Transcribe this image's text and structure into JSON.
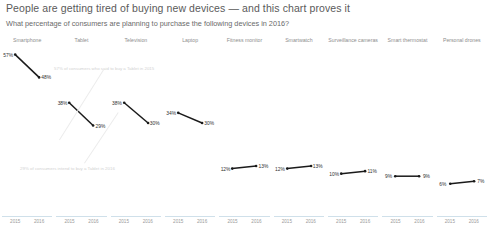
{
  "header": {
    "title": "People are getting tired of buying new devices — and this chart proves it",
    "subtitle": "What percentage of consumers are planning to purchase the following devices in 2016?"
  },
  "annotations": [
    {
      "text": "57% of consumers who said to buy a Tablet in 2015"
    },
    {
      "text": "29% of consumers intend to buy a Tablet in 2016"
    }
  ],
  "chart_data": {
    "type": "line",
    "title": "People are getting tired of buying new devices — and this chart proves it",
    "subtitle": "What percentage of consumers are planning to purchase the following devices in 2016?",
    "xlabel": "",
    "ylabel": "",
    "x": [
      "2015",
      "2016"
    ],
    "ylim": [
      0,
      60
    ],
    "grid": false,
    "legend": "none",
    "layout": "small-multiples",
    "series": [
      {
        "name": "Smartphone",
        "values": [
          57,
          48
        ],
        "labels": [
          "57%",
          "48%"
        ]
      },
      {
        "name": "Tablet",
        "values": [
          38,
          29
        ],
        "labels": [
          "38%",
          "29%"
        ]
      },
      {
        "name": "Television",
        "values": [
          38,
          30
        ],
        "labels": [
          "38%",
          "30%"
        ]
      },
      {
        "name": "Laptop",
        "values": [
          34,
          30
        ],
        "labels": [
          "34%",
          "30%"
        ]
      },
      {
        "name": "Fitness monitor",
        "values": [
          12,
          13
        ],
        "labels": [
          "12%",
          "13%"
        ]
      },
      {
        "name": "Smartwatch",
        "values": [
          12,
          13
        ],
        "labels": [
          "12%",
          "13%"
        ]
      },
      {
        "name": "Surveillance cameras",
        "values": [
          10,
          11
        ],
        "labels": [
          "10%",
          "11%"
        ]
      },
      {
        "name": "Smart thermostat",
        "values": [
          9,
          9
        ],
        "labels": [
          "9%",
          "9%"
        ]
      },
      {
        "name": "Personal drones",
        "values": [
          6,
          7
        ],
        "labels": [
          "6%",
          "7%"
        ]
      }
    ]
  },
  "colors": {
    "line": "#1a1a1a",
    "axis": "#cfe0ea",
    "header_text": "#8e8e8e",
    "annotation": "#d2d2d2"
  }
}
